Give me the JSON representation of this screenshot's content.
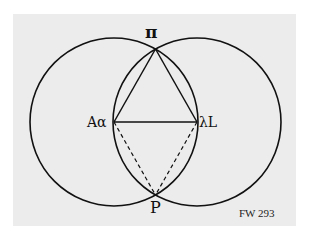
{
  "figure": {
    "background_color": "#ececec",
    "line_color": "#111111",
    "labels": {
      "top": "π",
      "left": "Aα",
      "right": "λL",
      "bottom": "P"
    },
    "caption": "FW 293",
    "geometry": {
      "circle_left": {
        "cx": 114,
        "cy": 122,
        "r": 84
      },
      "circle_right": {
        "cx": 197,
        "cy": 122,
        "r": 84
      },
      "points": {
        "top": [
          155.5,
          49
        ],
        "left": [
          114,
          122
        ],
        "right": [
          197,
          122
        ],
        "bottom": [
          155.5,
          195
        ]
      },
      "solid_segments": [
        "left-top",
        "top-right",
        "left-right"
      ],
      "dashed_segments": [
        "left-bottom",
        "right-bottom"
      ]
    }
  }
}
